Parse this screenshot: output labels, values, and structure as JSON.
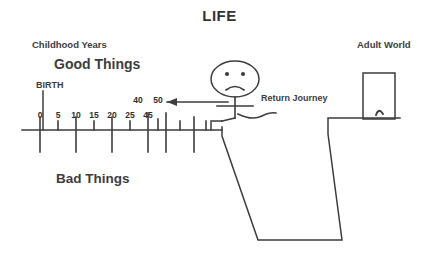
{
  "title": "LIFE",
  "background_color": "#ffffff",
  "ink_color": "#3d3d3d",
  "labels": {
    "childhood_years": "Childhood Years",
    "good_things": "Good Things",
    "bad_things": "Bad Things",
    "birth": "BIRTH",
    "adult_world": "Adult World",
    "return_journey": "Return Journey"
  },
  "timeline": {
    "axis_label_below": [
      "0",
      "5",
      "10",
      "15",
      "20",
      "25",
      "45"
    ],
    "axis_label_above": [
      "40",
      "50"
    ],
    "ticks": [
      {
        "label": "0",
        "x": 40,
        "type": "long"
      },
      {
        "label": "5",
        "x": 58,
        "type": "short"
      },
      {
        "label": "10",
        "x": 76,
        "type": "long"
      },
      {
        "label": "15",
        "x": 94,
        "type": "short"
      },
      {
        "label": "20",
        "x": 112,
        "type": "long"
      },
      {
        "label": "25",
        "x": 130,
        "type": "short"
      },
      {
        "label": "45",
        "x": 148,
        "type": "long"
      },
      {
        "label": "",
        "x": 158,
        "type": "short"
      },
      {
        "label": "",
        "x": 166,
        "type": "long"
      },
      {
        "label": "",
        "x": 180,
        "type": "short"
      },
      {
        "label": "",
        "x": 194,
        "type": "long"
      },
      {
        "label": "",
        "x": 206,
        "type": "short"
      }
    ],
    "upper_numbers": [
      {
        "label": "40",
        "x": 138
      },
      {
        "label": "50",
        "x": 158
      }
    ]
  },
  "figure": {
    "name": "sad-stick-figure",
    "expression": "frown",
    "eyes": 2
  },
  "door": {
    "name": "adult-world-door",
    "has_knob": true
  },
  "arrow": {
    "direction": "left",
    "meaning": "return-journey"
  }
}
